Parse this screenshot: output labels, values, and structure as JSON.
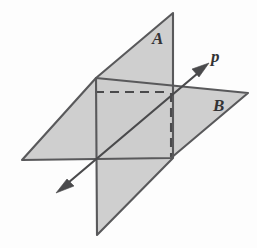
{
  "figure": {
    "background_color": "#fdfdfd",
    "plane_fill_color": "#cccccc",
    "edge_color": "#59595b",
    "line_color": "#4a4a4c",
    "label_color": "#333335"
  },
  "labels": {
    "plane_a": "A",
    "plane_b": "B",
    "line_p": "p"
  },
  "geometry": {
    "plane_a": {
      "name": "vertical-plane",
      "label": "A",
      "points": "96,78 173,13 173,158 97,235"
    },
    "plane_b": {
      "name": "horizontal-plane",
      "label": "B",
      "points": "22,160 96,78 248,93 171,158"
    },
    "intersection_line": {
      "name": "line-p",
      "label": "p",
      "from": "57,192",
      "to": "208,64",
      "visible_segment": "62,188 204,68"
    },
    "hidden_edges": [
      {
        "name": "hidden-horizontal-edge",
        "path": "M 95,92 L 170,92"
      },
      {
        "name": "hidden-vertical-edge",
        "path": "M 171,93 L 171,157"
      }
    ]
  },
  "label_positions": {
    "plane_a": {
      "x": 152,
      "y": 44
    },
    "plane_b": {
      "x": 213,
      "y": 111
    },
    "line_p": {
      "x": 211,
      "y": 62
    }
  }
}
